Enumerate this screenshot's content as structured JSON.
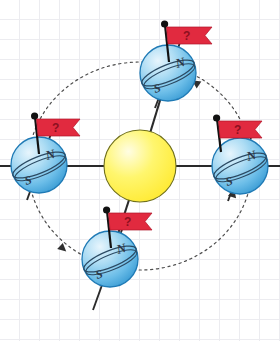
{
  "diagram": {
    "background": {
      "type": "graph-paper-grid",
      "grid_color": "#ececf0",
      "grid_spacing_px": 20,
      "page_color": "#ffffff"
    },
    "sun": {
      "name": "Sun",
      "color": "#FFF35C",
      "edge_color": "#6b6b1f",
      "center": {
        "x": 140,
        "y": 166
      },
      "radius": 36
    },
    "orbit": {
      "name": "orbit-path",
      "style": "dashed-ellipse",
      "color": "#555555",
      "direction": "counterclockwise",
      "cx": 140,
      "cy": 166,
      "rx": 112,
      "ry": 104,
      "arrows": [
        {
          "name": "orbit-arrow-upper-right",
          "x": 198,
          "y": 86,
          "angle": -135
        },
        {
          "name": "orbit-arrow-lower-left",
          "x": 58,
          "y": 245,
          "angle": 45
        },
        {
          "name": "orbit-arrow-lower-right",
          "x": 232,
          "y": 198,
          "angle": -68
        }
      ]
    },
    "globes": [
      {
        "id": "top",
        "name": "earth-globe-top",
        "north_label": "N",
        "south_label": "S",
        "center": {
          "x": 168,
          "y": 73
        },
        "radius": 28,
        "axis_tilt_deg": 23,
        "flag": {
          "label": "?",
          "color": "#E12A3F",
          "pole_color": "#1a1a1a"
        }
      },
      {
        "id": "left",
        "name": "earth-globe-left",
        "north_label": "N",
        "south_label": "S",
        "center": {
          "x": 39,
          "y": 165
        },
        "radius": 28,
        "axis_tilt_deg": 23,
        "flag": {
          "label": "?",
          "color": "#E12A3F",
          "pole_color": "#1a1a1a"
        }
      },
      {
        "id": "right",
        "name": "earth-globe-right",
        "north_label": "N",
        "south_label": "S",
        "center": {
          "x": 240,
          "y": 166
        },
        "radius": 28,
        "axis_tilt_deg": 23,
        "flag": {
          "label": "?",
          "color": "#E12A3F",
          "pole_color": "#1a1a1a"
        }
      },
      {
        "id": "bottom",
        "name": "earth-globe-bottom",
        "north_label": "N",
        "south_label": "S",
        "center": {
          "x": 110,
          "y": 259
        },
        "radius": 28,
        "axis_tilt_deg": 23,
        "flag": {
          "label": "?",
          "color": "#E12A3F",
          "pole_color": "#1a1a1a"
        }
      }
    ],
    "rays": {
      "name": "sun-earth-connector-lines",
      "color": "#2a2a2a",
      "count": 4
    },
    "colors": {
      "earth_light": "#cfeaf9",
      "earth_mid": "#8fcdee",
      "earth_dark": "#4aa8dd",
      "earth_edge": "#1f7ab5",
      "flag_red": "#E12A3F",
      "flag_question": "#8d1020",
      "sun_yellow": "#FFF35C",
      "line_black": "#2a2a2a"
    }
  }
}
